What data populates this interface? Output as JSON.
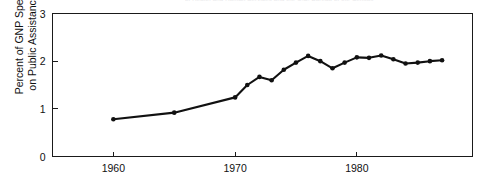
{
  "figure": {
    "caption_remnant": "of Health and Human Services and the U.S. Bureau of the Census",
    "background_color": "#ffffff",
    "line_color": "#111111",
    "axis_color": "#1a1a1a"
  },
  "chart_data": {
    "type": "line",
    "title": "",
    "xlabel": "",
    "ylabel": "Percent of GNP Spent\non Public Assistance",
    "xlim": [
      1955,
      1989.5
    ],
    "ylim": [
      0,
      3
    ],
    "xticks": [
      1960,
      1970,
      1980
    ],
    "xticklabels": [
      "1960",
      "1970",
      "1980"
    ],
    "yticks": [
      0,
      1,
      2,
      3
    ],
    "yticklabels": [
      "0",
      "1",
      "2",
      "3"
    ],
    "grid": false,
    "legend": null,
    "markers": true,
    "x": [
      1960,
      1965,
      1970,
      1971,
      1972,
      1973,
      1974,
      1975,
      1976,
      1977,
      1978,
      1979,
      1980,
      1981,
      1982,
      1983,
      1984,
      1985,
      1986,
      1987
    ],
    "values": [
      0.78,
      0.92,
      1.24,
      1.5,
      1.67,
      1.6,
      1.82,
      1.97,
      2.11,
      2.0,
      1.85,
      1.97,
      2.08,
      2.07,
      2.12,
      2.04,
      1.95,
      1.97,
      2.0,
      2.02
    ],
    "series": [
      {
        "name": "Percent of GNP Spent on Public Assistance",
        "x": [
          1960,
          1965,
          1970,
          1971,
          1972,
          1973,
          1974,
          1975,
          1976,
          1977,
          1978,
          1979,
          1980,
          1981,
          1982,
          1983,
          1984,
          1985,
          1986,
          1987
        ],
        "values": [
          0.78,
          0.92,
          1.24,
          1.5,
          1.67,
          1.6,
          1.82,
          1.97,
          2.11,
          2.0,
          1.85,
          1.97,
          2.08,
          2.07,
          2.12,
          2.04,
          1.95,
          1.97,
          2.0,
          2.02
        ]
      }
    ]
  }
}
